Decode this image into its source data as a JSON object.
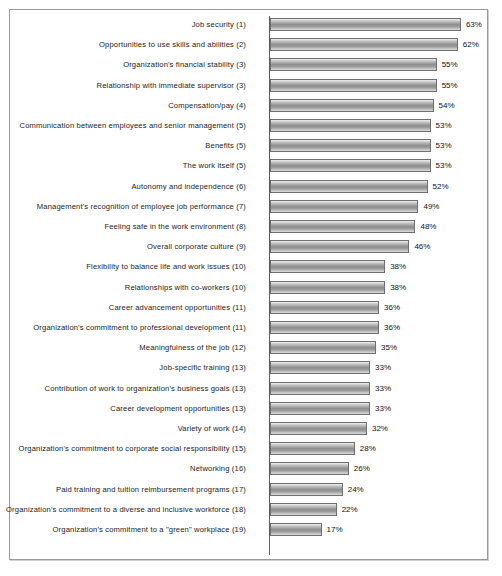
{
  "chart_data": {
    "type": "bar",
    "orientation": "horizontal",
    "title": "",
    "subtitle": "",
    "xlabel": "",
    "ylabel": "",
    "xlim": [
      0,
      70
    ],
    "grid": false,
    "legend": null,
    "value_suffix": "%",
    "bar_color": "#8d8d8d",
    "axis_color": "#5d5d5d",
    "border_color": "#9a9a9a",
    "text_color": "#1b1b1b",
    "categories": [
      "Job security (1)",
      "Opportunities to use skills and abilities (2)",
      "Organization's financial stability (3)",
      "Relationship with immediate supervisor (3)",
      "Compensation/pay (4)",
      "Communication between employees and senior management (5)",
      "Benefits (5)",
      "The work itself (5)",
      "Autonomy and independence (6)",
      "Management's recognition of employee job performance (7)",
      "Feeling safe in the work environment (8)",
      "Overall corporate culture (9)",
      "Flexibility to balance life and work issues (10)",
      "Relationships with co-workers (10)",
      "Career advancement opportunities (11)",
      "Organization's commitment to professional development (11)",
      "Meaningfulness of the job (12)",
      "Job-specific training (13)",
      "Contribution of work to organization's business goals (13)",
      "Career development opportunities (13)",
      "Variety of work (14)",
      "Organization's commitment to corporate social responsibility (15)",
      "Networking (16)",
      "Paid training and tuition reimbursement programs (17)",
      "Organization's commitment to a diverse and inclusive workforce (18)",
      "Organization's commitment to a \"green\" workplace (19)"
    ],
    "values": [
      63,
      62,
      55,
      55,
      54,
      53,
      53,
      53,
      52,
      49,
      48,
      46,
      38,
      38,
      36,
      36,
      35,
      33,
      33,
      33,
      32,
      28,
      26,
      24,
      22,
      17
    ],
    "value_labels": [
      "63%",
      "62%",
      "55%",
      "55%",
      "54%",
      "53%",
      "53%",
      "53%",
      "52%",
      "49%",
      "48%",
      "46%",
      "38%",
      "38%",
      "36%",
      "36%",
      "35%",
      "33%",
      "33%",
      "33%",
      "32%",
      "28%",
      "26%",
      "24%",
      "22%",
      "17%"
    ]
  },
  "layout": {
    "px_per_unit": 3.03,
    "row_pitch": 20.2,
    "first_row_top": 4,
    "bar_height": 13
  }
}
